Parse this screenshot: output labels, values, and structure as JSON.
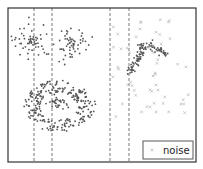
{
  "chart_data": {
    "type": "scatter",
    "title": "",
    "xlabel": "",
    "ylabel": "",
    "grid": false,
    "axes_ticks": false,
    "frame": {
      "x": 8,
      "y": 8,
      "width": 188,
      "height": 154,
      "color": "#333333"
    },
    "vertical_dashed_lines": [
      34,
      52,
      110,
      129
    ],
    "dashed_line_color": "#555555",
    "legend": {
      "position": "lower right",
      "entries": [
        {
          "label": "noise",
          "marker": "x",
          "color": "#b5b5b5"
        }
      ]
    },
    "clusters": [
      {
        "name": "blob-1",
        "shape": "gaussian",
        "cx": 32,
        "cy": 41,
        "sx": 10,
        "sy": 9,
        "n": 45,
        "dense_core": 12,
        "color": "#555555"
      },
      {
        "name": "blob-2",
        "shape": "gaussian",
        "cx": 71,
        "cy": 42,
        "sx": 10,
        "sy": 9,
        "n": 45,
        "dense_core": 12,
        "color": "#555555"
      },
      {
        "name": "ring",
        "shape": "ring",
        "cx": 58,
        "cy": 106,
        "rx": 26,
        "ry": 20,
        "thickness": 8,
        "n": 240,
        "color": "#555555"
      },
      {
        "name": "ring-core",
        "shape": "gaussian",
        "cx": 59,
        "cy": 103,
        "sx": 4.5,
        "sy": 2.5,
        "n": 30,
        "dense_core": 0,
        "color": "#555555"
      },
      {
        "name": "moon",
        "shape": "moon",
        "cx": 150,
        "cy": 58,
        "n": 110,
        "color": "#555555"
      }
    ],
    "noise": {
      "label": "noise",
      "marker": "x",
      "color": "#b5b5b5",
      "region": {
        "x0": 112,
        "y0": 18,
        "x1": 190,
        "y1": 118
      },
      "n": 55
    }
  },
  "legend": {
    "noise_label": "noise"
  }
}
